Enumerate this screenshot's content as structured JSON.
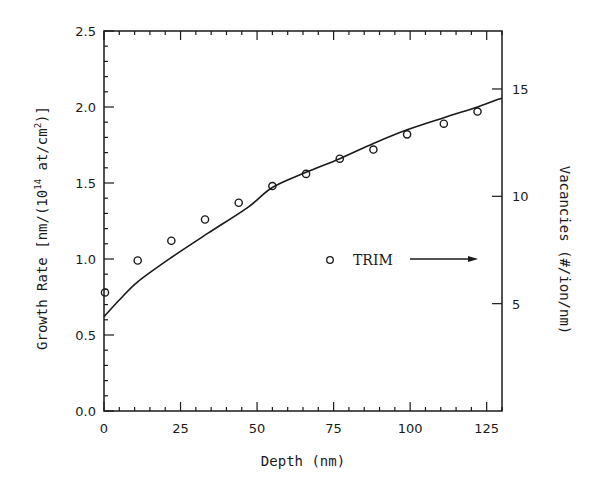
{
  "chart_data": {
    "type": "scatter",
    "title": "",
    "xlabel": "Depth (nm)",
    "ylabel": "Growth Rate [nm/(10^14 at/cm^2)]",
    "ylabel_parts": {
      "pre": "Growth Rate [nm/(10",
      "exp1": "14",
      "mid": " at/cm",
      "exp2": "2",
      "post": ")]"
    },
    "y2label": "Vacancies (#/ion/nm)",
    "xlim": [
      0,
      130
    ],
    "ylim": [
      0,
      2.5
    ],
    "y2lim": [
      0,
      17.7
    ],
    "grid": false,
    "x_ticks": [
      0,
      25,
      50,
      75,
      100,
      125
    ],
    "x_tick_labels": [
      "0",
      "25",
      "50",
      "75",
      "100",
      "125"
    ],
    "y_ticks": [
      0.0,
      0.5,
      1.0,
      1.5,
      2.0,
      2.5
    ],
    "y_tick_labels": [
      "0.0",
      "0.5",
      "1.0",
      "1.5",
      "2.0",
      "2.5"
    ],
    "y2_ticks": [
      5,
      10,
      15
    ],
    "y2_tick_labels": [
      "5",
      "10",
      "15"
    ],
    "legend": {
      "label": "TRIM",
      "position": "inside-right",
      "arrow": "points to right axis"
    },
    "series": [
      {
        "name": "Growth rate (measured fit)",
        "kind": "line",
        "axis": "left",
        "x": [
          0,
          5,
          11,
          22,
          34,
          47,
          55,
          66,
          77,
          88,
          99,
          111,
          122,
          130
        ],
        "y": [
          0.62,
          0.73,
          0.85,
          1.01,
          1.17,
          1.34,
          1.47,
          1.57,
          1.66,
          1.76,
          1.85,
          1.93,
          2.0,
          2.06
        ]
      },
      {
        "name": "TRIM",
        "kind": "scatter",
        "marker": "open-circle",
        "axis": "left",
        "x": [
          0,
          11,
          22,
          33,
          44,
          55,
          66,
          77,
          88,
          99,
          111,
          122
        ],
        "y": [
          0.78,
          0.99,
          1.12,
          1.26,
          1.37,
          1.48,
          1.56,
          1.66,
          1.72,
          1.82,
          1.89,
          1.97
        ]
      }
    ]
  },
  "colors": {
    "ink": "#1a1a1a",
    "background": "#ffffff"
  }
}
